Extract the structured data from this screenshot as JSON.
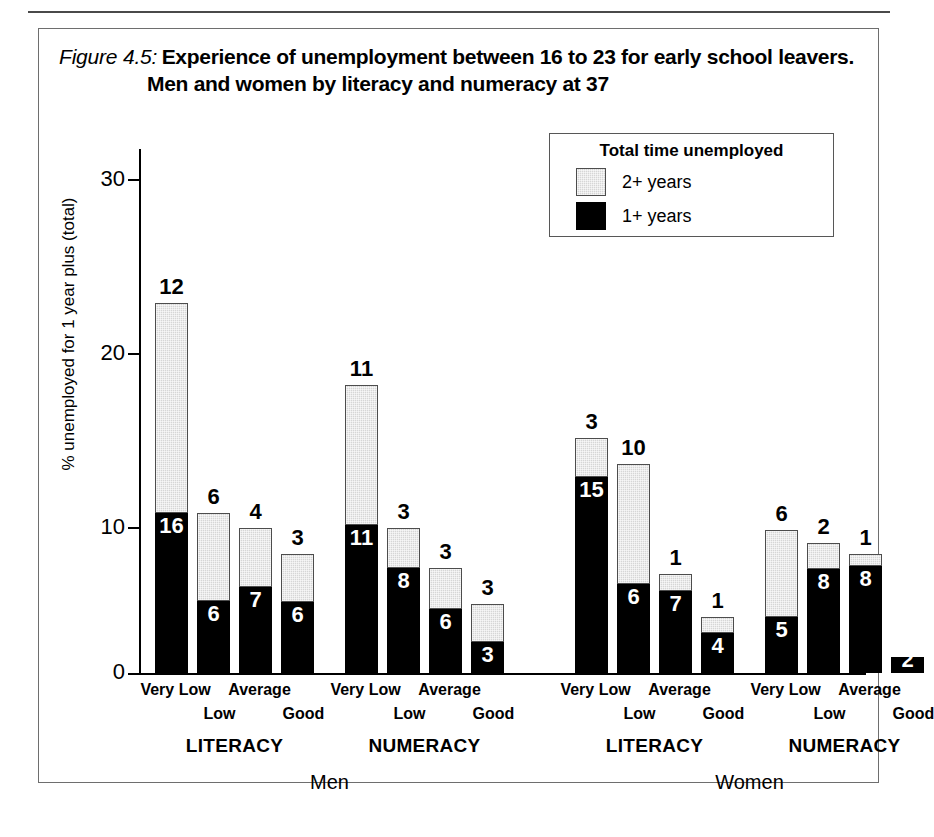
{
  "figure": {
    "number_label": "Figure 4.5:",
    "caption_line1": "Experience of unemployment between 16 to 23 for early school leavers.",
    "caption_line2": "Men and women by literacy and numeracy at 37"
  },
  "legend": {
    "title": "Total time unemployed",
    "items": [
      {
        "label": "2+ years",
        "swatch": "grey",
        "color": "#d6d6d6"
      },
      {
        "label": "1+ years",
        "swatch": "black",
        "color": "#000000"
      }
    ]
  },
  "axes": {
    "y_label": "% unemployed for 1 year plus (total)",
    "y_ticks": [
      "0",
      "10",
      "20",
      "30"
    ],
    "y_min": 0,
    "y_max": 30
  },
  "groups": [
    {
      "sex": "Men",
      "skill": "LITERACY"
    },
    {
      "sex": "Men",
      "skill": "NUMERACY"
    },
    {
      "sex": "Women",
      "skill": "LITERACY"
    },
    {
      "sex": "Women",
      "skill": "NUMERACY"
    }
  ],
  "chart_data": {
    "type": "bar",
    "stacked": true,
    "title": "Experience of unemployment between 16 to 23 for early school leavers. Men and women by literacy and numeracy at 37",
    "xlabel": "",
    "ylabel": "% unemployed for 1 year plus (total)",
    "ylim": [
      0,
      30
    ],
    "yticks": [
      0,
      10,
      20,
      30
    ],
    "grid": false,
    "legend_position": "top-right",
    "legend_title": "Total time unemployed",
    "series": [
      {
        "name": "1+ years",
        "color": "#000000"
      },
      {
        "name": "2+ years",
        "color": "#d6d6d6"
      }
    ],
    "categories": [
      "Very Low",
      "Low",
      "Average",
      "Good"
    ],
    "panels": [
      {
        "sex": "Men",
        "skill": "LITERACY",
        "bars": [
          {
            "category": "Very Low",
            "total": 22.5,
            "one_plus": 9.7,
            "two_plus": 12.8,
            "label_top": "12",
            "label_inner": "16"
          },
          {
            "category": "Low",
            "total": 9.7,
            "one_plus": 4.4,
            "two_plus": 5.3,
            "label_top": "6",
            "label_inner": "6"
          },
          {
            "category": "Average",
            "total": 8.8,
            "one_plus": 5.2,
            "two_plus": 3.6,
            "label_top": "4",
            "label_inner": "7"
          },
          {
            "category": "Good",
            "total": 7.2,
            "one_plus": 4.3,
            "two_plus": 2.9,
            "label_top": "3",
            "label_inner": "6"
          }
        ]
      },
      {
        "sex": "Men",
        "skill": "NUMERACY",
        "bars": [
          {
            "category": "Very Low",
            "total": 17.5,
            "one_plus": 9.0,
            "two_plus": 8.5,
            "label_top": "11",
            "label_inner": "11"
          },
          {
            "category": "Low",
            "total": 8.8,
            "one_plus": 6.4,
            "two_plus": 2.4,
            "label_top": "3",
            "label_inner": "8"
          },
          {
            "category": "Average",
            "total": 6.4,
            "one_plus": 3.9,
            "two_plus": 2.5,
            "label_top": "3",
            "label_inner": "6"
          },
          {
            "category": "Good",
            "total": 4.2,
            "one_plus": 1.9,
            "two_plus": 2.3,
            "label_top": "3",
            "label_inner": "3"
          }
        ]
      },
      {
        "sex": "Women",
        "skill": "LITERACY",
        "bars": [
          {
            "category": "Very Low",
            "total": 14.3,
            "one_plus": 11.9,
            "two_plus": 2.4,
            "label_top": "3",
            "label_inner": "15"
          },
          {
            "category": "Low",
            "total": 12.7,
            "one_plus": 5.4,
            "two_plus": 7.3,
            "label_top": "10",
            "label_inner": "6"
          },
          {
            "category": "Average",
            "total": 6.0,
            "one_plus": 5.0,
            "two_plus": 1.0,
            "label_top": "1",
            "label_inner": "7"
          },
          {
            "category": "Good",
            "total": 3.4,
            "one_plus": 2.4,
            "two_plus": 1.0,
            "label_top": "1",
            "label_inner": "4"
          }
        ]
      },
      {
        "sex": "Women",
        "skill": "NUMERACY",
        "bars": [
          {
            "category": "Very Low",
            "total": 8.7,
            "one_plus": 3.4,
            "two_plus": 5.3,
            "label_top": "6",
            "label_inner": "5"
          },
          {
            "category": "Low",
            "total": 7.9,
            "one_plus": 6.3,
            "two_plus": 1.6,
            "label_top": "2",
            "label_inner": "8"
          },
          {
            "category": "Average",
            "total": 7.2,
            "one_plus": 6.5,
            "two_plus": 0.7,
            "label_top": "1",
            "label_inner": "8"
          },
          {
            "category": "Good",
            "total": 1.0,
            "one_plus": 1.0,
            "two_plus": 0.0,
            "label_top": "",
            "label_inner": "2"
          }
        ]
      }
    ]
  }
}
